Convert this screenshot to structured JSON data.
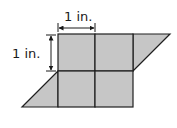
{
  "diagram": {
    "labels": {
      "width": "1 in.",
      "height": "1 in."
    },
    "colors": {
      "fill": "#c6c6c6",
      "stroke": "#1f1f1f",
      "text": "#1a1a1a"
    }
  }
}
